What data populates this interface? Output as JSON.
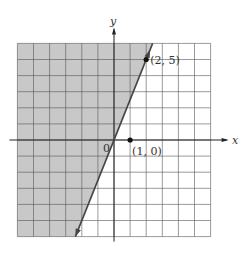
{
  "chart_data": {
    "type": "region",
    "title": "",
    "xlabel": "x",
    "ylabel": "y",
    "xlim": [
      -6,
      6
    ],
    "ylim": [
      -6,
      6
    ],
    "grid": true,
    "grid_step": 1,
    "boundary_line": {
      "equation": "y = 2.5x",
      "slope": 2.5,
      "intercept": 0,
      "style": "solid",
      "arrows": "both"
    },
    "shaded_region": {
      "inequality": "y > 2.5x",
      "side": "left"
    },
    "points": [
      {
        "x": 2,
        "y": 5,
        "label": "(2, 5)"
      },
      {
        "x": 1,
        "y": 0,
        "label": "(1, 0)"
      }
    ],
    "origin_label": "0",
    "colors": {
      "shade": "#c8c8c8",
      "grid": "#555555",
      "line": "#444444",
      "axis": "#222222"
    }
  }
}
